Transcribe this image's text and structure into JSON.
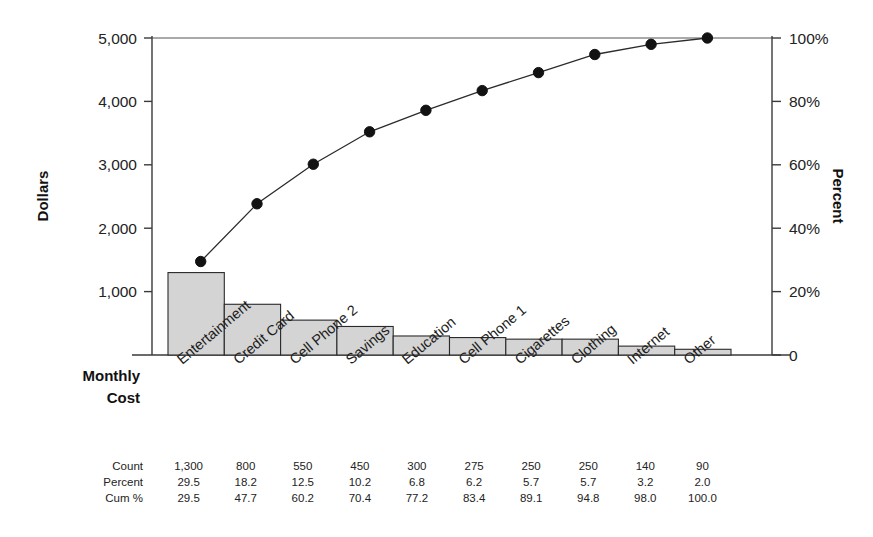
{
  "chart_data": {
    "type": "bar",
    "title": "",
    "subtitle": "",
    "xlabel": "Monthly Cost",
    "ylabel": "Dollars",
    "y2label": "Percent",
    "grid": false,
    "legend": "none",
    "categories": [
      "Entertainment",
      "Credit Card",
      "Cell Phone 2",
      "Savings",
      "Education",
      "Cell Phone 1",
      "Cigarettes",
      "Clothing",
      "Internet",
      "Other"
    ],
    "series": [
      {
        "name": "Count",
        "type": "bar",
        "axis": "left",
        "values": [
          1300,
          800,
          550,
          450,
          300,
          275,
          250,
          250,
          140,
          90
        ]
      },
      {
        "name": "Cum %",
        "type": "line",
        "axis": "right",
        "values": [
          29.5,
          47.7,
          60.2,
          70.4,
          77.2,
          83.4,
          89.1,
          94.8,
          98.0,
          100.0
        ]
      }
    ],
    "percent": [
      29.5,
      18.2,
      12.5,
      10.2,
      6.8,
      6.2,
      5.7,
      5.7,
      3.2,
      2.0
    ],
    "ylim": [
      0,
      5000
    ],
    "y2lim": [
      0,
      100
    ],
    "yticks": [
      1000,
      2000,
      3000,
      4000,
      5000
    ],
    "ytick_labels": [
      "1,000",
      "2,000",
      "3,000",
      "4,000",
      "5,000"
    ],
    "y2ticks": [
      0,
      20,
      40,
      60,
      80,
      100
    ],
    "y2tick_labels": [
      "0",
      "20%",
      "40%",
      "60%",
      "80%",
      "100%"
    ],
    "colors": {
      "bar_fill": "#d4d4d4",
      "bar_stroke": "#2a2a2a",
      "line": "#2b2b2b",
      "marker": "#121212",
      "axis": "#3a3a3a",
      "text": "#232323"
    }
  },
  "axes": {
    "left": {
      "title": "Dollars",
      "ticks": [
        {
          "value": 5000,
          "label": "5,000"
        },
        {
          "value": 4000,
          "label": "4,000"
        },
        {
          "value": 3000,
          "label": "3,000"
        },
        {
          "value": 2000,
          "label": "2,000"
        },
        {
          "value": 1000,
          "label": "1,000"
        }
      ]
    },
    "right": {
      "title": "Percent",
      "ticks": [
        {
          "value": 100,
          "label": "100%"
        },
        {
          "value": 80,
          "label": "80%"
        },
        {
          "value": 60,
          "label": "60%"
        },
        {
          "value": 40,
          "label": "40%"
        },
        {
          "value": 20,
          "label": "20%"
        },
        {
          "value": 0,
          "label": "0"
        }
      ]
    },
    "bottom": {
      "corner_label_line1": "Monthly",
      "corner_label_line2": "Cost"
    }
  },
  "data_table": {
    "row_labels": [
      "Count",
      "Percent",
      "Cum %"
    ],
    "rows": [
      {
        "label": "Count",
        "cells": [
          "1,300",
          "800",
          "550",
          "450",
          "300",
          "275",
          "250",
          "250",
          "140",
          "90"
        ]
      },
      {
        "label": "Percent",
        "cells": [
          "29.5",
          "18.2",
          "12.5",
          "10.2",
          "6.8",
          "6.2",
          "5.7",
          "5.7",
          "3.2",
          "2.0"
        ]
      },
      {
        "label": "Cum %",
        "cells": [
          "29.5",
          "47.7",
          "60.2",
          "70.4",
          "77.2",
          "83.4",
          "89.1",
          "94.8",
          "98.0",
          "100.0"
        ]
      }
    ]
  }
}
